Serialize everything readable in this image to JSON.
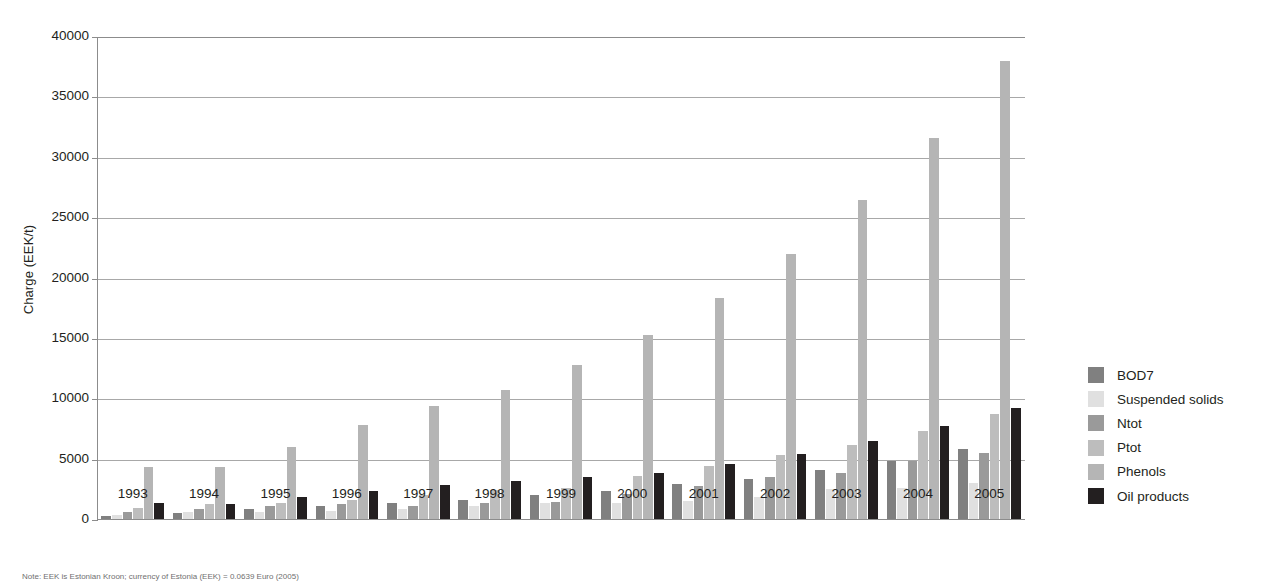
{
  "chart_data": {
    "type": "bar",
    "title": "",
    "subtitle": "",
    "xlabel": "",
    "ylabel": "Charge (EEK/t)",
    "ylim": [
      0,
      40000
    ],
    "yticks": [
      0,
      5000,
      10000,
      15000,
      20000,
      25000,
      30000,
      35000,
      40000
    ],
    "ytick_labels": [
      "0",
      "5000",
      "10000",
      "15000",
      "20000",
      "25000",
      "30000",
      "35000",
      "40000"
    ],
    "grid": true,
    "grid_axis": "y",
    "legend_position": "right",
    "categories": [
      "1993",
      "1994",
      "1995",
      "1996",
      "1997",
      "1998",
      "1999",
      "2000",
      "2001",
      "2002",
      "2003",
      "2004",
      "2005"
    ],
    "series": [
      {
        "name": "BOD7",
        "color": "#808080",
        "values": [
          250,
          520,
          800,
          1060,
          1300,
          1600,
          1980,
          2340,
          2880,
          3300,
          4100,
          4840,
          5780
        ]
      },
      {
        "name": "Suspended solids",
        "color": "#e0e0e0",
        "values": [
          330,
          560,
          540,
          700,
          860,
          1050,
          1290,
          1290,
          1520,
          1800,
          2520,
          2540,
          3020
        ]
      },
      {
        "name": "Ntot",
        "color": "#9a9a9a",
        "values": [
          580,
          830,
          1100,
          1230,
          1110,
          1330,
          1420,
          2060,
          2700,
          3450,
          3840,
          4770,
          5450
        ]
      },
      {
        "name": "Ptot",
        "color": "#bdbdbd",
        "values": [
          880,
          1230,
          1330,
          1600,
          1970,
          2390,
          2530,
          3540,
          4370,
          5270,
          6090,
          7250,
          8700
        ]
      },
      {
        "name": "Phenols",
        "color": "#b5b5b5",
        "values": [
          4280,
          4290,
          5980,
          7770,
          9320,
          10650,
          12780,
          15240,
          18330,
          21970,
          26380,
          31550,
          37900
        ]
      },
      {
        "name": "Oil products",
        "color": "#231f20",
        "values": [
          1290,
          1250,
          1830,
          2330,
          2790,
          3170,
          3490,
          3820,
          4570,
          5390,
          6430,
          7730,
          9190
        ]
      }
    ],
    "thin_bars": {
      "note": "Phenols bar is rendered narrow in some groups",
      "narrow_series": "Phenols"
    }
  },
  "legend": {
    "items": [
      {
        "label": "BOD7",
        "color": "#808080"
      },
      {
        "label": "Suspended solids",
        "color": "#e0e0e0"
      },
      {
        "label": "Ntot",
        "color": "#9a9a9a"
      },
      {
        "label": "Ptot",
        "color": "#bdbdbd"
      },
      {
        "label": "Phenols",
        "color": "#b5b5b5"
      },
      {
        "label": "Oil products",
        "color": "#231f20"
      }
    ]
  },
  "note": "Note: EEK is Estonian Kroon; currency of Estonia (EEK) = 0.0639 Euro (2005)"
}
